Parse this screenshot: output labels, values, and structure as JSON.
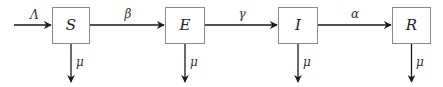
{
  "diagram": {
    "type": "compartment-flow",
    "colors": {
      "line": "#1a1a1a",
      "box_border": "#8a8a8a",
      "text": "#222222",
      "background": "#ffffff"
    },
    "inflow": {
      "label": "Λ",
      "target": "S"
    },
    "nodes": [
      {
        "id": "S",
        "label": "S",
        "death_rate": "μ"
      },
      {
        "id": "E",
        "label": "E",
        "death_rate": "μ"
      },
      {
        "id": "I",
        "label": "I",
        "death_rate": "μ"
      },
      {
        "id": "R",
        "label": "R",
        "death_rate": "μ"
      }
    ],
    "edges": [
      {
        "from": "S",
        "to": "E",
        "label": "β"
      },
      {
        "from": "E",
        "to": "I",
        "label": "γ"
      },
      {
        "from": "I",
        "to": "R",
        "label": "α"
      }
    ]
  }
}
